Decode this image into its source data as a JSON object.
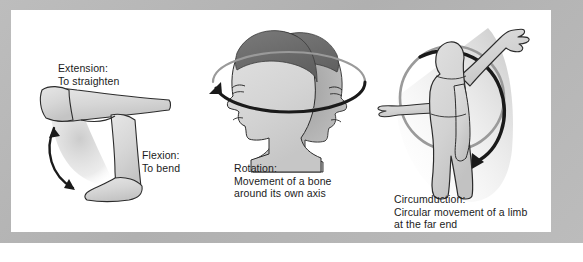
{
  "figure": {
    "background_color": "#ffffff",
    "frame_color": "#b4b4b4",
    "panel_color": "#ffffff",
    "limb_fill_color": "#d8d8d8",
    "limb_outline_color": "#2b2b2b",
    "hair_color": "#6a6a6a",
    "arrow_color": "#1a1a1a",
    "ring_color": "#8c8c8c",
    "shadow_color": "#bfbfbf"
  },
  "panels": [
    {
      "id": "extension-flexion",
      "name": "extension-and-flexion-panel",
      "illustration": "bent-leg-at-knee-with-double-headed-curved-arrow",
      "labels": [
        {
          "id": "extension",
          "term": "Extension:",
          "definition": "To straighten",
          "text": "Extension:\nTo straighten"
        },
        {
          "id": "flexion",
          "term": "Flexion:",
          "definition": "To bend",
          "text": "Flexion:\nTo bend"
        }
      ]
    },
    {
      "id": "rotation",
      "name": "rotation-panel",
      "illustration": "two-overlapping-head-profiles-with-elliptical-arrow",
      "labels": [
        {
          "id": "rotation",
          "term": "Rotation:",
          "definition": "Movement of a bone around its own axis",
          "text": "Rotation:\nMovement of a bone\naround its own axis"
        }
      ]
    },
    {
      "id": "circumduction",
      "name": "circumduction-panel",
      "illustration": "standing-figure-with-raised-arm-and-circular-arrow",
      "labels": [
        {
          "id": "circumduction",
          "term": "Circumduction:",
          "definition": "Circular movement of a limb at the far end",
          "text": "Circumduction:\nCircular movement of a limb\nat the far end"
        }
      ]
    }
  ]
}
